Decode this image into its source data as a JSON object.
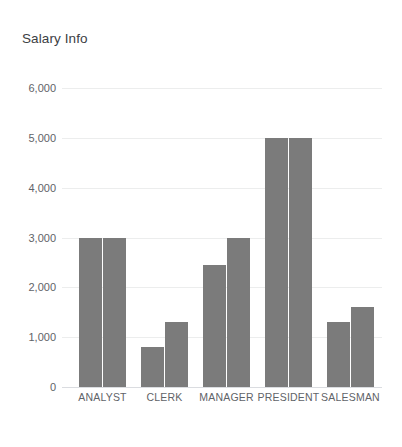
{
  "chart_data": {
    "type": "bar",
    "title": "Salary Info",
    "xlabel": "",
    "ylabel": "",
    "categories": [
      "ANALYST",
      "CLERK",
      "MANAGER",
      "PRESIDENT",
      "SALESMAN"
    ],
    "series": [
      {
        "name": "series-1",
        "values": [
          3000,
          800,
          2450,
          5000,
          1300
        ]
      },
      {
        "name": "series-2",
        "values": [
          3000,
          1300,
          3000,
          5000,
          1600
        ]
      }
    ],
    "ylim": [
      0,
      6000
    ],
    "ytick_values": [
      0,
      1000,
      2000,
      3000,
      4000,
      5000,
      6000
    ],
    "ytick_labels": [
      "0",
      "1,000",
      "2,000",
      "3,000",
      "4,000",
      "5,000",
      "6,000"
    ],
    "grid": true,
    "legend": false,
    "bar_color": "#7b7b7b",
    "gridline_color": "#eceded",
    "axis_color": "#dadce0",
    "title_color": "#3c4043",
    "tick_label_color": "#5f6368",
    "background_color": "#ffffff"
  }
}
